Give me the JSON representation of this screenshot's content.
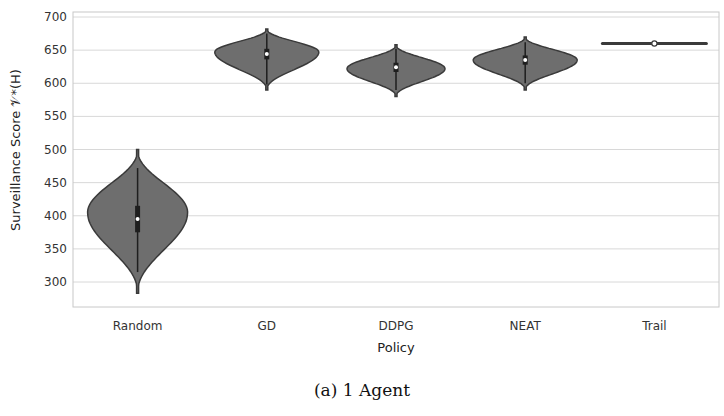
{
  "chart_data": {
    "type": "violin",
    "title": "",
    "xlabel": "Policy",
    "ylabel": "Surveillance Score 𝒱*(H)",
    "categories": [
      "Random",
      "GD",
      "DDPG",
      "NEAT",
      "Trail"
    ],
    "ylim": [
      260,
      700
    ],
    "yticks": [
      300,
      350,
      400,
      450,
      500,
      550,
      600,
      650,
      700
    ],
    "grid": true,
    "legend": null,
    "series": [
      {
        "name": "Random",
        "min": 283,
        "max": 500,
        "median": 395,
        "q1": 375,
        "q3": 415,
        "mode": 405,
        "whisker_low": 315,
        "whisker_high": 472
      },
      {
        "name": "GD",
        "min": 590,
        "max": 682,
        "median": 644,
        "q1": 636,
        "q3": 652,
        "mode": 647,
        "whisker_low": 598,
        "whisker_high": 675
      },
      {
        "name": "DDPG",
        "min": 580,
        "max": 658,
        "median": 624,
        "q1": 617,
        "q3": 631,
        "mode": 622,
        "whisker_low": 590,
        "whisker_high": 652
      },
      {
        "name": "NEAT",
        "min": 590,
        "max": 670,
        "median": 635,
        "q1": 628,
        "q3": 642,
        "mode": 635,
        "whisker_low": 600,
        "whisker_high": 662
      },
      {
        "name": "Trail",
        "min": 659,
        "max": 661,
        "median": 660,
        "q1": 660,
        "q3": 660,
        "mode": 660,
        "whisker_low": 660,
        "whisker_high": 660
      }
    ],
    "colors": {
      "violin_fill": "#6e6e6e",
      "violin_edge": "#3a3a3a",
      "grid": "#d8d8d8",
      "frame": "#c8c8c8"
    }
  },
  "caption": "(a) 1 Agent"
}
